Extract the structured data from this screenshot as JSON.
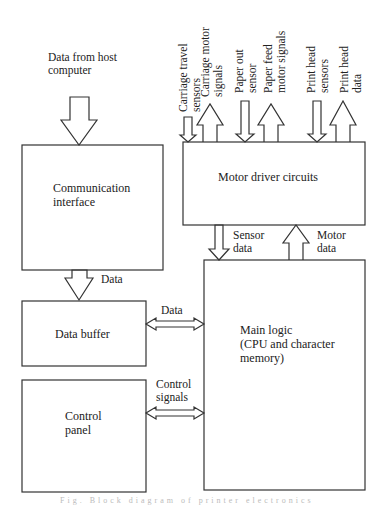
{
  "diagram": {
    "type": "block-diagram",
    "blocks": {
      "communication_interface": [
        "Communication",
        "interface"
      ],
      "data_buffer": [
        "Data buffer"
      ],
      "control_panel": [
        "Control",
        "panel"
      ],
      "motor_driver": [
        "Motor driver circuits"
      ],
      "main_logic": [
        "Main logic",
        "(CPU and character",
        "memory)"
      ]
    },
    "inputs": {
      "host": [
        "Data from host",
        "computer"
      ]
    },
    "top_signals": [
      {
        "lines": [
          "Carriage travel",
          "sensors"
        ],
        "direction": "in"
      },
      {
        "lines": [
          "Carriage motor",
          "signals"
        ],
        "direction": "out"
      },
      {
        "lines": [
          "Paper out",
          "sensor"
        ],
        "direction": "in"
      },
      {
        "lines": [
          "Paper feed",
          "motor signals"
        ],
        "direction": "out"
      },
      {
        "lines": [
          "Print head",
          "sensors"
        ],
        "direction": "in"
      },
      {
        "lines": [
          "Print head",
          "data"
        ],
        "direction": "out"
      }
    ],
    "links": {
      "comm_to_buffer": "Data",
      "buffer_main": "Data",
      "panel_main": [
        "Control",
        "signals"
      ],
      "sensor_data": [
        "Sensor",
        "data"
      ],
      "motor_data": [
        "Motor",
        "data"
      ]
    },
    "caption": "Fig. Block diagram of printer electronics"
  }
}
